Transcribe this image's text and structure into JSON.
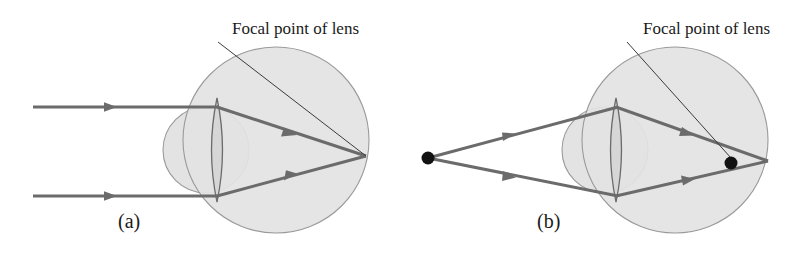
{
  "figure": {
    "width": 798,
    "height": 276,
    "background_color": "#ffffff"
  },
  "style": {
    "ray_color": "#6b6b6b",
    "eyeball_fill": "#e3e3e3",
    "eyeball_stroke": "#9a9a9a",
    "lens_fill": "#d2d2d2",
    "lens_stroke": "#6b6b6b",
    "cornea_stroke": "#9a9a9a",
    "point_color": "#121212",
    "leader_color": "#3a3a3a",
    "text_color": "#1a1a1a"
  },
  "panels": [
    {
      "id": "a",
      "letter": "(a)",
      "letter_x": 118,
      "letter_y": 228,
      "label": "Focal point of lens",
      "label_x": 232,
      "label_y": 34,
      "leader": {
        "x1": 218,
        "y1": 42,
        "x2": 366,
        "y2": 156
      },
      "eyeball": {
        "cx": 276,
        "cy": 140,
        "r": 93
      },
      "cornea": {
        "cx": 206,
        "cy": 150,
        "r": 43
      },
      "lens": {
        "cx": 217,
        "cy": 150,
        "half_height": 52,
        "half_width": 11
      },
      "focal_point": {
        "x": 366,
        "y": 156,
        "marked": false
      },
      "source": {
        "type": "parallel-rays",
        "marked": false
      },
      "rays": [
        {
          "name": "upper-ray",
          "incoming": {
            "x1": 33,
            "y1": 107,
            "x2": 217,
            "y2": 107
          },
          "outgoing": {
            "x1": 217,
            "y1": 107,
            "x2": 366,
            "y2": 156
          },
          "arrows": [
            {
              "x": 112,
              "y": 107,
              "angle": 0
            },
            {
              "x": 292,
              "y": 133,
              "angle": 18.2
            }
          ]
        },
        {
          "name": "lower-ray",
          "incoming": {
            "x1": 33,
            "y1": 196,
            "x2": 217,
            "y2": 196
          },
          "outgoing": {
            "x1": 217,
            "y1": 196,
            "x2": 366,
            "y2": 156
          },
          "arrows": [
            {
              "x": 112,
              "y": 196,
              "angle": 0
            },
            {
              "x": 292,
              "y": 176,
              "angle": -15.0
            }
          ]
        }
      ]
    },
    {
      "id": "b",
      "letter": "(b)",
      "letter_x": 537,
      "letter_y": 228,
      "label": "Focal point of lens",
      "label_x": 643,
      "label_y": 34,
      "leader": {
        "x1": 627,
        "y1": 42,
        "x2": 731,
        "y2": 160
      },
      "eyeball": {
        "cx": 675,
        "cy": 140,
        "r": 93
      },
      "cornea": {
        "cx": 605,
        "cy": 150,
        "r": 43
      },
      "lens": {
        "cx": 616,
        "cy": 150,
        "half_height": 52,
        "half_width": 11
      },
      "focal_point": {
        "x": 731,
        "y": 163,
        "marked": true
      },
      "source": {
        "type": "point-source",
        "x": 428,
        "y": 158,
        "marked": true
      },
      "rays": [
        {
          "name": "upper-ray",
          "incoming": {
            "x1": 428,
            "y1": 158,
            "x2": 616,
            "y2": 107
          },
          "outgoing": {
            "x1": 616,
            "y1": 107,
            "x2": 768,
            "y2": 161
          },
          "arrows": [
            {
              "x": 510,
              "y": 136,
              "angle": -15.2
            },
            {
              "x": 690,
              "y": 133,
              "angle": 19.5
            }
          ]
        },
        {
          "name": "lower-ray",
          "incoming": {
            "x1": 428,
            "y1": 158,
            "x2": 616,
            "y2": 196
          },
          "outgoing": {
            "x1": 616,
            "y1": 196,
            "x2": 768,
            "y2": 161
          },
          "arrows": [
            {
              "x": 510,
              "y": 177,
              "angle": 11.4
            },
            {
              "x": 690,
              "y": 180,
              "angle": -13.0
            }
          ]
        }
      ]
    }
  ]
}
